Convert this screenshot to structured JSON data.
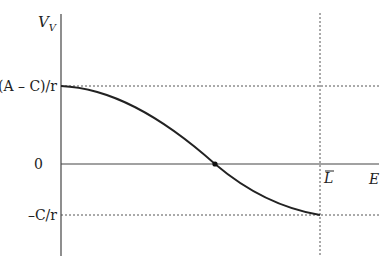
{
  "diagram": {
    "type": "function-plot",
    "y_axis": {
      "label": "V",
      "label_subscript": "V"
    },
    "x_axis": {
      "label": "E"
    },
    "y_ticks": [
      {
        "label": "(A – C)/r",
        "role": "max-value"
      },
      {
        "label": "0",
        "role": "origin"
      },
      {
        "label": "–C/r",
        "role": "min-value"
      }
    ],
    "x_ticks": [
      {
        "label": "L",
        "overline": true,
        "role": "upper-bound"
      }
    ],
    "curve": {
      "description": "Decreasing S-shaped curve starting at (A–C)/r at E=0, crossing zero (marked point), ending at –C/r at E=L̅",
      "start": "(A – C)/r",
      "end": "–C/r",
      "zero_crossing_marked": true
    },
    "guides": [
      "dotted horizontal at (A – C)/r",
      "dotted horizontal at –C/r",
      "dotted vertical at L̅"
    ],
    "colors": {
      "line": "#222222",
      "guide": "#555555",
      "axis": "#444444"
    }
  }
}
